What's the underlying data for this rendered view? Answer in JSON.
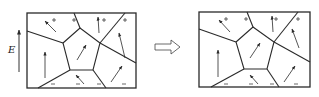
{
  "diagram": {
    "field_label": "E",
    "transition_arrow": "open-right-arrow",
    "colors": {
      "line": "#2a2a2a",
      "background": "#ffffff"
    },
    "panels": [
      {
        "id": "before",
        "frame": [
          27,
          13,
          136,
          88
        ],
        "plus_signs": [
          [
            54,
            20
          ],
          [
            74,
            20
          ],
          [
            104,
            20
          ],
          [
            125,
            20
          ]
        ],
        "minus_signs": [
          [
            53,
            84
          ],
          [
            78,
            84
          ],
          [
            99,
            84
          ],
          [
            124,
            84
          ]
        ],
        "domain_arrows": [
          {
            "from": [
              56,
              32
            ],
            "to": [
              45,
              21
            ]
          },
          {
            "from": [
              99,
              33
            ],
            "to": [
              98,
              17
            ]
          },
          {
            "from": [
              45,
              78
            ],
            "to": [
              45,
              52
            ]
          },
          {
            "from": [
              77,
              60
            ],
            "to": [
              86,
              45
            ]
          },
          {
            "from": [
              125,
              58
            ],
            "to": [
              119,
              33
            ]
          },
          {
            "from": [
              84,
              84
            ],
            "to": [
              76,
              75
            ]
          },
          {
            "from": [
              111,
              82
            ],
            "to": [
              122,
              66
            ]
          }
        ]
      },
      {
        "id": "after",
        "frame": [
          199,
          12,
          310,
          87
        ],
        "plus_signs": [
          [
            226,
            19
          ],
          [
            246,
            19
          ],
          [
            276,
            19
          ],
          [
            298,
            19
          ]
        ],
        "minus_signs": [
          [
            226,
            84
          ],
          [
            251,
            84
          ],
          [
            272,
            84
          ],
          [
            296,
            84
          ]
        ],
        "domain_arrows": [
          {
            "from": [
              230,
              32
            ],
            "to": [
              219,
              20
            ]
          },
          {
            "from": [
              273,
              32
            ],
            "to": [
              272,
              16
            ]
          },
          {
            "from": [
              218,
              77
            ],
            "to": [
              218,
              50
            ]
          },
          {
            "from": [
              250,
              58
            ],
            "to": [
              260,
              43
            ]
          },
          {
            "from": [
              299,
              48
            ],
            "to": [
              292,
              29
            ]
          },
          {
            "from": [
              258,
              84
            ],
            "to": [
              250,
              75
            ]
          },
          {
            "from": [
              284,
              82
            ],
            "to": [
              295,
              66
            ]
          }
        ]
      }
    ]
  }
}
